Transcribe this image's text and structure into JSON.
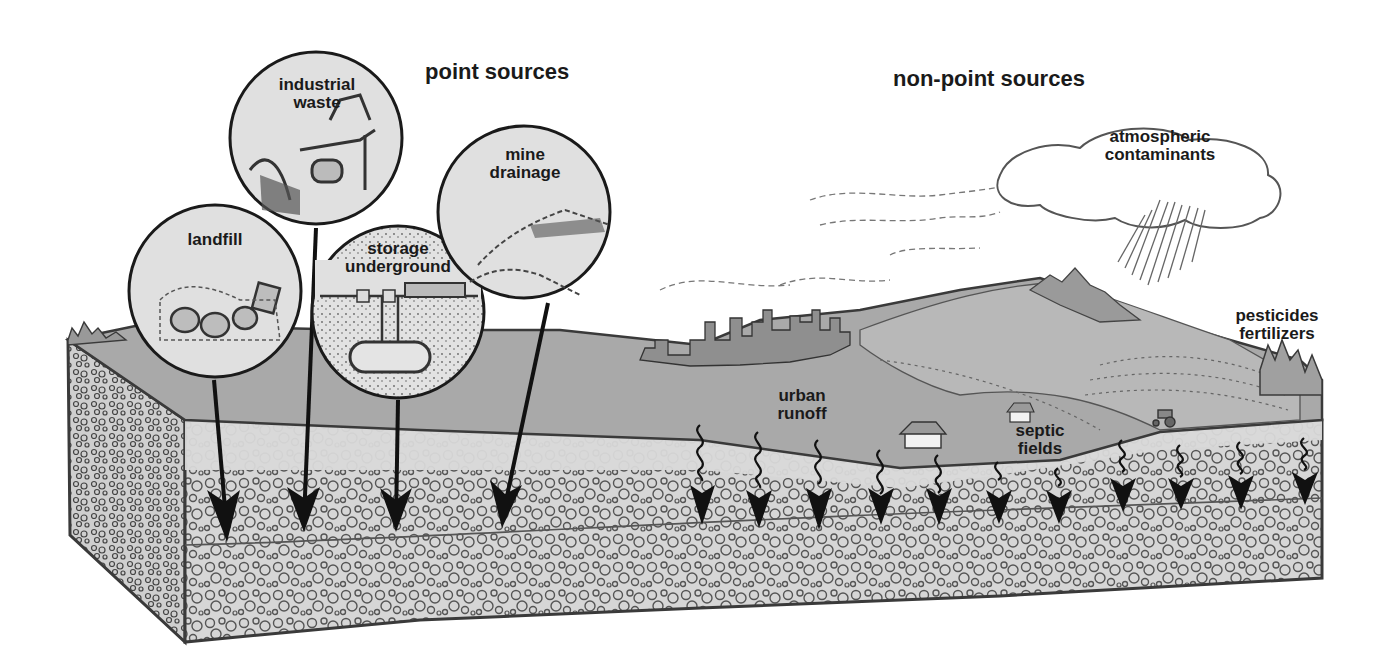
{
  "headers": {
    "point_sources": "point sources",
    "non_point_sources": "non-point sources"
  },
  "point_sources": [
    {
      "id": "industrial-waste",
      "line1": "industrial",
      "line2": "waste"
    },
    {
      "id": "landfill",
      "line1": "landfill",
      "line2": ""
    },
    {
      "id": "storage-underground",
      "line1": "storage",
      "line2": "underground"
    },
    {
      "id": "mine-drainage",
      "line1": "mine",
      "line2": "drainage"
    }
  ],
  "non_point_sources": [
    {
      "id": "atmospheric-contaminants",
      "line1": "atmospheric",
      "line2": "contaminants"
    },
    {
      "id": "pesticides-fertilizers",
      "line1": "pesticides",
      "line2": "fertilizers"
    },
    {
      "id": "urban-runoff",
      "line1": "urban",
      "line2": "runoff"
    },
    {
      "id": "septic-fields",
      "line1": "septic",
      "line2": "fields"
    }
  ],
  "colors": {
    "land_surface": "#a9a9a9",
    "soil": "#d6d6d6",
    "outline": "#3a3a3a",
    "inset_fill": "#dedede",
    "arrow": "#111111"
  }
}
